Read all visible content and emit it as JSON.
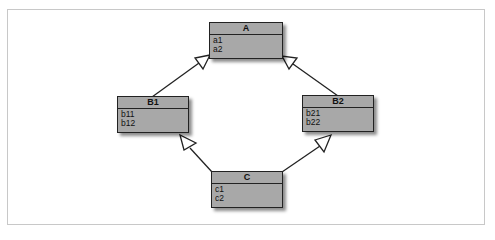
{
  "diagram": {
    "type": "uml-class-diagram",
    "classes": [
      {
        "id": "A",
        "name": "A",
        "attributes": [
          "a1",
          "a2"
        ]
      },
      {
        "id": "B1",
        "name": "B1",
        "attributes": [
          "b11",
          "b12"
        ]
      },
      {
        "id": "B2",
        "name": "B2",
        "attributes": [
          "b21",
          "b22"
        ]
      },
      {
        "id": "C",
        "name": "C",
        "attributes": [
          "c1",
          "c2"
        ]
      }
    ],
    "relations": [
      {
        "from": "B1",
        "to": "A",
        "kind": "generalization"
      },
      {
        "from": "B2",
        "to": "A",
        "kind": "generalization"
      },
      {
        "from": "C",
        "to": "B1",
        "kind": "generalization"
      },
      {
        "from": "C",
        "to": "B2",
        "kind": "generalization"
      }
    ],
    "colors": {
      "box_fill": "#a8a8a8",
      "border": "#222222",
      "frame": "#c8c8c8"
    }
  }
}
